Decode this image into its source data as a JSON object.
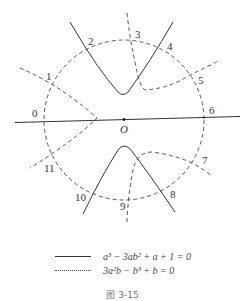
{
  "figure": {
    "origin_label": "O",
    "point_labels": [
      "0",
      "1",
      "2",
      "3",
      "4",
      "5",
      "6",
      "7",
      "8",
      "9",
      "10",
      "11"
    ],
    "legend": [
      {
        "style": "solid",
        "equation": "a³ − 3ab² + a + 1 = 0"
      },
      {
        "style": "dashed",
        "equation": "3a²b − b³ + b = 0"
      }
    ],
    "caption": "图 3-15",
    "colors": {
      "line": "#333333",
      "background": "#ffffff"
    }
  }
}
